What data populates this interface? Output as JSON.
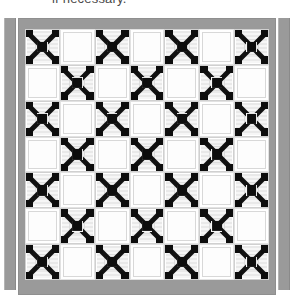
{
  "caption": {
    "text": "if necessary."
  },
  "scene": {
    "title": "quilt-on-stand",
    "colors": {
      "border_gray": "#9a9a9a",
      "rack_gray": "#9a9a9a",
      "patch_black": "#0d0d0d",
      "patch_light": "#e9e9e9",
      "background_white": "#ffffff"
    }
  },
  "quilt": {
    "label": "patchwork-quilt",
    "border_label": "gray fabric border",
    "grid": {
      "columns": 7,
      "rows": 7
    },
    "block_types": {
      "x": "x-cross chain block",
      "plain": "plain white block"
    },
    "blocks": [
      [
        "x",
        "plain",
        "x",
        "plain",
        "x",
        "plain",
        "x"
      ],
      [
        "plain",
        "x",
        "plain",
        "x",
        "plain",
        "x",
        "plain"
      ],
      [
        "x",
        "plain",
        "x",
        "plain",
        "x",
        "plain",
        "x"
      ],
      [
        "plain",
        "x",
        "plain",
        "x",
        "plain",
        "x",
        "plain"
      ],
      [
        "x",
        "plain",
        "x",
        "plain",
        "x",
        "plain",
        "x"
      ],
      [
        "plain",
        "x",
        "plain",
        "x",
        "plain",
        "x",
        "plain"
      ],
      [
        "x",
        "plain",
        "x",
        "plain",
        "x",
        "plain",
        "x"
      ]
    ]
  },
  "rack": {
    "left_label": "left stand post",
    "right_label": "right stand post"
  }
}
